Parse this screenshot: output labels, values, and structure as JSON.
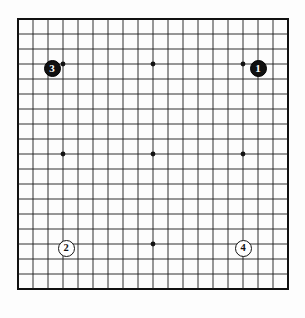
{
  "figure": {
    "kind": "go-board-diagram",
    "board_size": 19,
    "background_color": "#fdfdfd",
    "line_color": "#1a1a1a",
    "border_color": "#111111",
    "star_point_color": "#111111"
  },
  "board": {
    "lines": 19,
    "left_px": 17,
    "top_px": 18,
    "size_px": 272,
    "spacing_px": 15.111,
    "star_points": [
      {
        "col": 4,
        "row": 4
      },
      {
        "col": 10,
        "row": 4
      },
      {
        "col": 16,
        "row": 4
      },
      {
        "col": 4,
        "row": 10
      },
      {
        "col": 10,
        "row": 10
      },
      {
        "col": 16,
        "row": 10
      },
      {
        "col": 4,
        "row": 16
      },
      {
        "col": 10,
        "row": 16
      },
      {
        "col": 16,
        "row": 16
      }
    ]
  },
  "stones": [
    {
      "label": "1",
      "color": "black",
      "color_hex": "#111111",
      "text_color": "#ffffff",
      "col": 17,
      "row": 4,
      "x_px": 258,
      "y_px": 68,
      "diameter_px": 17
    },
    {
      "label": "2",
      "color": "white",
      "color_hex": "#ffffff",
      "text_color": "#111111",
      "col": 4,
      "row": 16,
      "x_px": 66,
      "y_px": 248,
      "diameter_px": 17
    },
    {
      "label": "3",
      "color": "black",
      "color_hex": "#111111",
      "text_color": "#ffffff",
      "col": 3,
      "row": 4,
      "x_px": 52,
      "y_px": 68,
      "diameter_px": 17
    },
    {
      "label": "4",
      "color": "white",
      "color_hex": "#ffffff",
      "text_color": "#111111",
      "col": 16,
      "row": 16,
      "x_px": 243,
      "y_px": 248,
      "diameter_px": 17
    }
  ]
}
